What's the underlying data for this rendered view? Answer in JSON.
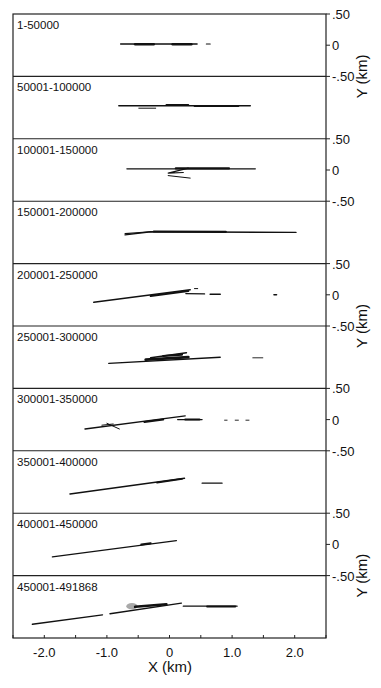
{
  "chart_data": {
    "type": "line",
    "title": "",
    "xlabel": "X (km)",
    "ylabel": "Y (km)",
    "xlim": [
      -2.5,
      2.5
    ],
    "ylim_per_panel": [
      -0.5,
      0.5
    ],
    "x_ticks": [
      -2.0,
      -1.0,
      0,
      1.0,
      2.0
    ],
    "x_tick_labels": [
      "-2.0",
      "-1.0",
      "0",
      "1.0",
      "2.0"
    ],
    "x_minor_tick_step": 0.5,
    "y_tick_labels": [
      ".50",
      "0",
      "-.50"
    ],
    "y_tick_labels_shown_on_panels": [
      0,
      2,
      4,
      6,
      8
    ],
    "ylabel_shown_on_panels": [
      0.5,
      4.5,
      8.5
    ],
    "grid": false,
    "legend": null,
    "panels": [
      {
        "label": "1-50000",
        "segments": [
          {
            "pts": [
              [
                -0.78,
                0.02
              ],
              [
                0.44,
                0.02
              ]
            ],
            "w": 1.6
          },
          {
            "pts": [
              [
                -0.55,
                0.015
              ],
              [
                -0.25,
                0.015
              ]
            ],
            "w": 2.4
          },
          {
            "pts": [
              [
                0.05,
                0.015
              ],
              [
                0.35,
                0.015
              ]
            ],
            "w": 2.4
          },
          {
            "pts": [
              [
                0.59,
                0.02
              ],
              [
                0.65,
                0.02
              ]
            ],
            "w": 1.2
          }
        ]
      },
      {
        "label": "50001-100000",
        "segments": [
          {
            "pts": [
              [
                -0.81,
                0.03
              ],
              [
                1.29,
                0.03
              ]
            ],
            "w": 1.4
          },
          {
            "pts": [
              [
                -0.49,
                -0.01
              ],
              [
                -0.22,
                -0.01
              ]
            ],
            "w": 1.0
          },
          {
            "pts": [
              [
                -0.05,
                0.045
              ],
              [
                0.3,
                0.045
              ]
            ],
            "w": 1.8
          },
          {
            "pts": [
              [
                0.4,
                0.025
              ],
              [
                1.1,
                0.025
              ]
            ],
            "w": 1.8
          }
        ]
      },
      {
        "label": "100001-150000",
        "segments": [
          {
            "pts": [
              [
                -0.68,
                0.02
              ],
              [
                1.37,
                0.02
              ]
            ],
            "w": 1.3
          },
          {
            "pts": [
              [
                0.1,
                0.025
              ],
              [
                0.95,
                0.025
              ]
            ],
            "w": 2.2
          },
          {
            "pts": [
              [
                0.3,
                0.03
              ],
              [
                -0.02,
                -0.05
              ],
              [
                0.22,
                -0.04
              ]
            ],
            "w": 1.2
          },
          {
            "pts": [
              [
                -0.02,
                -0.09
              ],
              [
                0.33,
                -0.13
              ]
            ],
            "w": 1.0
          }
        ]
      },
      {
        "label": "150001-200000",
        "segments": [
          {
            "pts": [
              [
                -0.71,
                -0.04
              ],
              [
                -0.3,
                0.01
              ],
              [
                2.02,
                0.0
              ]
            ],
            "w": 1.4
          },
          {
            "pts": [
              [
                -0.71,
                -0.02
              ],
              [
                -0.25,
                0.015
              ]
            ],
            "w": 1.2
          },
          {
            "pts": [
              [
                -0.25,
                0.015
              ],
              [
                0.9,
                0.01
              ]
            ],
            "w": 2.2
          }
        ]
      },
      {
        "label": "200001-250000",
        "segments": [
          {
            "pts": [
              [
                -1.21,
                -0.12
              ],
              [
                0.33,
                0.08
              ]
            ],
            "w": 1.5
          },
          {
            "pts": [
              [
                -0.3,
                -0.02
              ],
              [
                0.3,
                0.06
              ]
            ],
            "w": 2.0
          },
          {
            "pts": [
              [
                0.26,
                0.02
              ],
              [
                0.56,
                0.015
              ]
            ],
            "w": 1.2
          },
          {
            "pts": [
              [
                0.65,
                0.01
              ],
              [
                0.81,
                0.01
              ]
            ],
            "w": 1.6
          },
          {
            "pts": [
              [
                0.4,
                0.1
              ],
              [
                0.45,
                0.1
              ]
            ],
            "w": 1.0
          },
          {
            "pts": [
              [
                1.67,
                0.0
              ],
              [
                1.71,
                0.0
              ]
            ],
            "w": 1.6
          }
        ]
      },
      {
        "label": "250001-300000",
        "segments": [
          {
            "pts": [
              [
                -0.97,
                -0.1
              ],
              [
                0.81,
                0.0
              ]
            ],
            "w": 1.4
          },
          {
            "pts": [
              [
                -0.38,
                -0.04
              ],
              [
                0.3,
                0.0
              ]
            ],
            "w": 2.8
          },
          {
            "pts": [
              [
                -0.3,
                -0.01
              ],
              [
                0.27,
                0.07
              ]
            ],
            "w": 1.6
          },
          {
            "pts": [
              [
                -0.1,
                0.02
              ],
              [
                0.2,
                0.04
              ]
            ],
            "w": 2.2
          },
          {
            "pts": [
              [
                1.33,
                -0.01
              ],
              [
                1.49,
                -0.01
              ]
            ],
            "w": 0.9
          }
        ]
      },
      {
        "label": "300001-350000",
        "segments": [
          {
            "pts": [
              [
                -1.35,
                -0.15
              ],
              [
                0.25,
                0.06
              ]
            ],
            "w": 1.4
          },
          {
            "pts": [
              [
                -1.0,
                -0.06
              ],
              [
                -0.8,
                -0.15
              ]
            ],
            "w": 1.0
          },
          {
            "pts": [
              [
                -1.08,
                -0.09
              ],
              [
                -0.9,
                -0.07
              ]
            ],
            "w": 1.0
          },
          {
            "pts": [
              [
                -0.4,
                -0.04
              ],
              [
                -0.1,
                0.0
              ]
            ],
            "w": 2.0
          },
          {
            "pts": [
              [
                0.13,
                0.0
              ],
              [
                0.52,
                0.0
              ]
            ],
            "w": 1.2
          },
          {
            "pts": [
              [
                0.25,
                0.0
              ],
              [
                0.48,
                0.0
              ]
            ],
            "w": 2.0
          },
          {
            "pts": [
              [
                0.88,
                -0.01
              ],
              [
                0.92,
                -0.01
              ]
            ],
            "w": 0.9
          },
          {
            "pts": [
              [
                1.05,
                -0.01
              ],
              [
                1.1,
                -0.01
              ]
            ],
            "w": 0.9
          },
          {
            "pts": [
              [
                1.22,
                -0.01
              ],
              [
                1.27,
                -0.01
              ]
            ],
            "w": 0.9
          }
        ]
      },
      {
        "label": "350001-400000",
        "segments": [
          {
            "pts": [
              [
                -1.59,
                -0.19
              ],
              [
                0.24,
                0.06
              ]
            ],
            "w": 1.5
          },
          {
            "pts": [
              [
                -0.2,
                -0.01
              ],
              [
                0.2,
                0.05
              ]
            ],
            "w": 1.9
          },
          {
            "pts": [
              [
                0.52,
                -0.02
              ],
              [
                0.84,
                -0.02
              ]
            ],
            "w": 1.2
          }
        ]
      },
      {
        "label": "400001-450000",
        "segments": [
          {
            "pts": [
              [
                -1.87,
                -0.2
              ],
              [
                0.11,
                0.06
              ]
            ],
            "w": 1.3
          },
          {
            "pts": [
              [
                -0.45,
                0.0
              ],
              [
                -0.3,
                0.02
              ]
            ],
            "w": 2.0
          }
        ]
      },
      {
        "label": "450001-491868",
        "segments": [
          {
            "pts": [
              [
                -2.19,
                -0.28
              ],
              [
                -1.07,
                -0.13
              ]
            ],
            "w": 1.4
          },
          {
            "pts": [
              [
                -0.95,
                -0.11
              ],
              [
                0.19,
                0.06
              ]
            ],
            "w": 1.4
          },
          {
            "pts": [
              [
                -0.55,
                0.0
              ],
              [
                -0.05,
                0.04
              ]
            ],
            "w": 2.6
          },
          {
            "pts": [
              [
                0.22,
                0.01
              ],
              [
                1.08,
                0.01
              ]
            ],
            "w": 1.3
          },
          {
            "pts": [
              [
                0.6,
                0.005
              ],
              [
                1.05,
                0.005
              ]
            ],
            "w": 2.0
          }
        ],
        "blobs": [
          {
            "x": -0.6,
            "y": 0.01,
            "rx": 0.09,
            "ry": 0.05,
            "color": "#9a9a9a"
          }
        ]
      }
    ]
  },
  "colors": {
    "ink": "#111111",
    "frame": "#222222",
    "background": "#ffffff"
  }
}
